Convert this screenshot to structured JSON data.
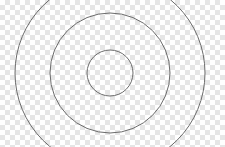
{
  "image": {
    "description": "Concentric circles on transparent checkerboard background",
    "background": "checkerboard",
    "stroke_color": "#6b6b6b",
    "center": [
      110,
      73
    ],
    "circles": [
      {
        "name": "inner",
        "radius": 23
      },
      {
        "name": "middle",
        "radius": 60
      },
      {
        "name": "outer",
        "radius": 95
      }
    ]
  },
  "caption": {
    "text": "…"
  }
}
